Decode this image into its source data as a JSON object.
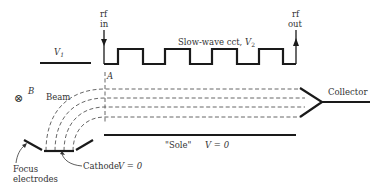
{
  "diagram": {
    "labels": {
      "rf_in_1": "rf",
      "rf_in_2": "in",
      "rf_out_1": "rf",
      "rf_out_2": "out",
      "v1": "V",
      "v1_sub": "1",
      "slow_wave": "Slow-wave cct, ",
      "v2": "V",
      "v2_sub": "2",
      "point_a": "A",
      "b_field_symbol": "⊗",
      "b_field": "B",
      "beam": "Beam",
      "collector": "Collector",
      "sole": "\"Sole\"",
      "sole_v": "V = 0",
      "cathode": "Cathode",
      "cathode_v": "V = 0",
      "focus_1": "Focus",
      "focus_2": "electrodes"
    },
    "colors": {
      "line": "#1a1a1a",
      "dash": "#555555",
      "text": "#333333",
      "background": "#ffffff"
    }
  }
}
